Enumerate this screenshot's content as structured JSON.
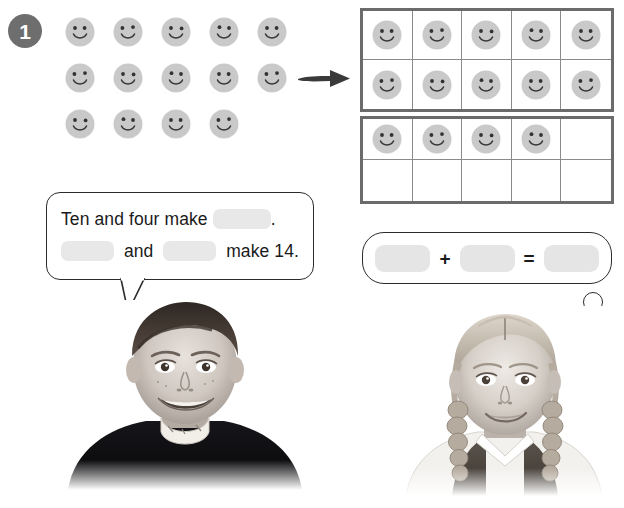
{
  "exercise": {
    "number": "1"
  },
  "counters": {
    "icon_name": "smiley-face-icon",
    "face_color": "#c9c9c9",
    "feature_color": "#333333",
    "loose_rows": [
      {
        "row_label": "row-1",
        "count": 5
      },
      {
        "row_label": "row-2",
        "count": 5
      },
      {
        "row_label": "row-3",
        "count": 4
      }
    ],
    "total_visible": 14
  },
  "arrow": {
    "icon_name": "right-arrow-icon",
    "direction": "right",
    "color": "#3a3a3a"
  },
  "ten_frames": [
    {
      "label": "ten-frame-top",
      "rows": 2,
      "columns": 5,
      "filled_count": 10,
      "cells": [
        true,
        true,
        true,
        true,
        true,
        true,
        true,
        true,
        true,
        true
      ]
    },
    {
      "label": "ten-frame-bottom",
      "rows": 2,
      "columns": 5,
      "filled_count": 4,
      "cells": [
        true,
        true,
        true,
        true,
        false,
        false,
        false,
        false,
        false,
        false
      ]
    }
  ],
  "speech_bubble": {
    "speaker": "boy",
    "line1": {
      "before": "Ten and four make",
      "blank": "",
      "after": "."
    },
    "line2": {
      "blank1": "",
      "middle": "and",
      "blank2": "",
      "after": "make 14."
    }
  },
  "thought_bubble": {
    "speaker": "girl",
    "addend1": "",
    "plus": "+",
    "addend2": "",
    "equals": "=",
    "sum": ""
  },
  "photos": [
    {
      "name": "photo-boy",
      "subject": "smiling boy",
      "style": "black-and-white"
    },
    {
      "name": "photo-girl",
      "subject": "smiling girl with braids",
      "style": "black-and-white"
    }
  ],
  "colors": {
    "badge_background": "#6e6e6e",
    "badge_text": "#ffffff",
    "frame_border": "#6b6b6b",
    "frame_inner_line": "#8a8a8a",
    "blank_fill": "#e8e8e8",
    "bubble_border": "#2b2b2b",
    "text": "#1a1a1a"
  }
}
